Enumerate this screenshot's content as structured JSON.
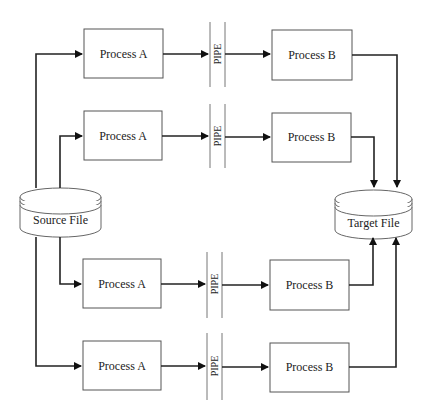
{
  "diagram": {
    "source": {
      "label": "Source File",
      "icon": "database-cylinder-icon"
    },
    "target": {
      "label": "Target File",
      "icon": "database-cylinder-icon"
    },
    "rows": [
      {
        "process_a": "Process A",
        "pipe": "PIPE",
        "process_b": "Process B"
      },
      {
        "process_a": "Process A",
        "pipe": "PIPE",
        "process_b": "Process B"
      },
      {
        "process_a": "Process A",
        "pipe": "PIPE",
        "process_b": "Process B"
      },
      {
        "process_a": "Process A",
        "pipe": "PIPE",
        "process_b": "Process B"
      }
    ]
  }
}
